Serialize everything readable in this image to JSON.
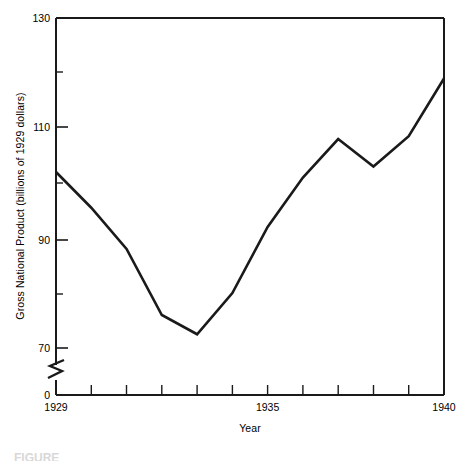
{
  "chart_data": {
    "type": "line",
    "title": "",
    "xlabel": "Year",
    "ylabel": "Gross National Product (billions of 1929 dollars)",
    "x": [
      1929,
      1930,
      1931,
      1932,
      1933,
      1934,
      1935,
      1936,
      1937,
      1938,
      1939,
      1940
    ],
    "values": [
      102,
      95.5,
      88,
      76,
      72.5,
      80,
      92,
      101,
      108,
      103,
      108.5,
      119
    ],
    "series": [
      {
        "name": "Gross National Product",
        "values": [
          102,
          95.5,
          88,
          76,
          72.5,
          80,
          92,
          101,
          108,
          103,
          108.5,
          119
        ]
      }
    ],
    "xlim": [
      1929,
      1940
    ],
    "ylim": [
      70,
      130
    ],
    "y_axis_break": true,
    "y_axis_break_between": [
      0,
      70
    ],
    "y_tick_values": [
      0,
      70,
      90,
      110,
      130
    ],
    "y_tick_labels": [
      "0",
      "70",
      "90",
      "110",
      "130"
    ],
    "y_minor_ticks": [
      80,
      100,
      120
    ],
    "x_tick_values": [
      1929,
      1930,
      1931,
      1932,
      1933,
      1934,
      1935,
      1936,
      1937,
      1938,
      1939,
      1940
    ],
    "x_tick_labels_shown": [
      "1929",
      "1935",
      "1940"
    ],
    "grid": false,
    "legend": false,
    "line_color": "#1a1a1a",
    "axis_color": "#1a1a1a"
  },
  "axes": {
    "y_label": "Gross National Product (billions of 1929 dollars)",
    "x_label": "Year",
    "y_ticks": [
      {
        "label": "130"
      },
      {
        "label": "110"
      },
      {
        "label": "90"
      },
      {
        "label": "70"
      },
      {
        "label": "0"
      }
    ],
    "x_ticks": [
      {
        "label": "1929"
      },
      {
        "label": "1935"
      },
      {
        "label": "1940"
      }
    ]
  },
  "caption": {
    "text": "FIGURE"
  }
}
